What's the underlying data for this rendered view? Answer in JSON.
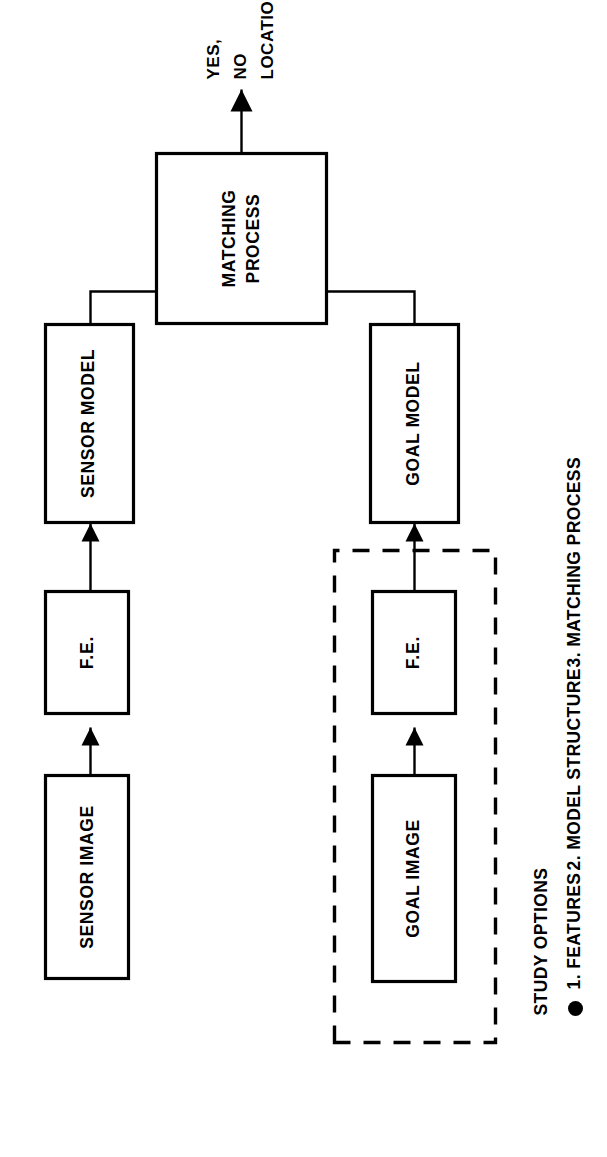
{
  "figure": {
    "type": "block-diagram",
    "orientation": "rotated-90-ccw",
    "background_color": "#ffffff",
    "line_color": "#000000",
    "blocks": [
      {
        "id": "sensor-image",
        "label": "SENSOR IMAGE",
        "column": "left",
        "border": "solid"
      },
      {
        "id": "sensor-fe",
        "label": "F.E.",
        "column": "left",
        "border": "solid"
      },
      {
        "id": "sensor-model",
        "label": "SENSOR MODEL",
        "column": "left",
        "border": "solid"
      },
      {
        "id": "matching-process",
        "label_line1": "MATCHING",
        "label_line2": "PROCESS",
        "column": "center",
        "border": "solid"
      },
      {
        "id": "goal-model",
        "label": "GOAL MODEL",
        "column": "right",
        "border": "solid"
      },
      {
        "id": "goal-fe",
        "label": "F.E.",
        "column": "right",
        "border": "solid"
      },
      {
        "id": "goal-image",
        "label": "GOAL IMAGE",
        "column": "right",
        "border": "solid"
      }
    ],
    "dashed_group": {
      "id": "goal-offline-group",
      "contains": [
        "goal-image",
        "goal-fe"
      ],
      "border": "dashed"
    },
    "output": {
      "id": "matching-output",
      "lines": [
        "YES,",
        "NO",
        "LOCATION"
      ]
    },
    "connections": [
      {
        "from": "sensor-image",
        "to": "sensor-fe",
        "arrow": true
      },
      {
        "from": "sensor-fe",
        "to": "sensor-model",
        "arrow": true
      },
      {
        "from": "sensor-model",
        "to": "matching-process",
        "arrow": true
      },
      {
        "from": "goal-image",
        "to": "goal-fe",
        "arrow": true
      },
      {
        "from": "goal-fe",
        "to": "goal-model",
        "arrow": true
      },
      {
        "from": "goal-model",
        "to": "matching-process",
        "arrow": true
      },
      {
        "from": "matching-process",
        "to": "matching-output",
        "arrow": true
      }
    ]
  },
  "caption": {
    "heading": "STUDY OPTIONS",
    "bullet_glyph": "●",
    "items": [
      "1. FEATURES",
      "2. MODEL STRUCTURE",
      "3. MATCHING PROCESS"
    ],
    "items_inline": "1. FEATURES   2. MODEL STRUCTURE   3. MATCHING PROCESS"
  }
}
